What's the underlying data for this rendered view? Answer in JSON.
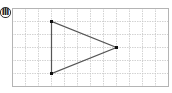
{
  "problem": {
    "label": "Ⅲ"
  },
  "grid": {
    "columns": 12,
    "rows": 6,
    "line_color": "#c8c8c8",
    "border_color": "#b4b4b4"
  },
  "shape": {
    "type": "triangle",
    "vertices": [
      {
        "col": 3,
        "row": 1
      },
      {
        "col": 3,
        "row": 5
      },
      {
        "col": 8,
        "row": 3
      }
    ],
    "edge_color": "#555555",
    "vertex_color": "#111111"
  }
}
